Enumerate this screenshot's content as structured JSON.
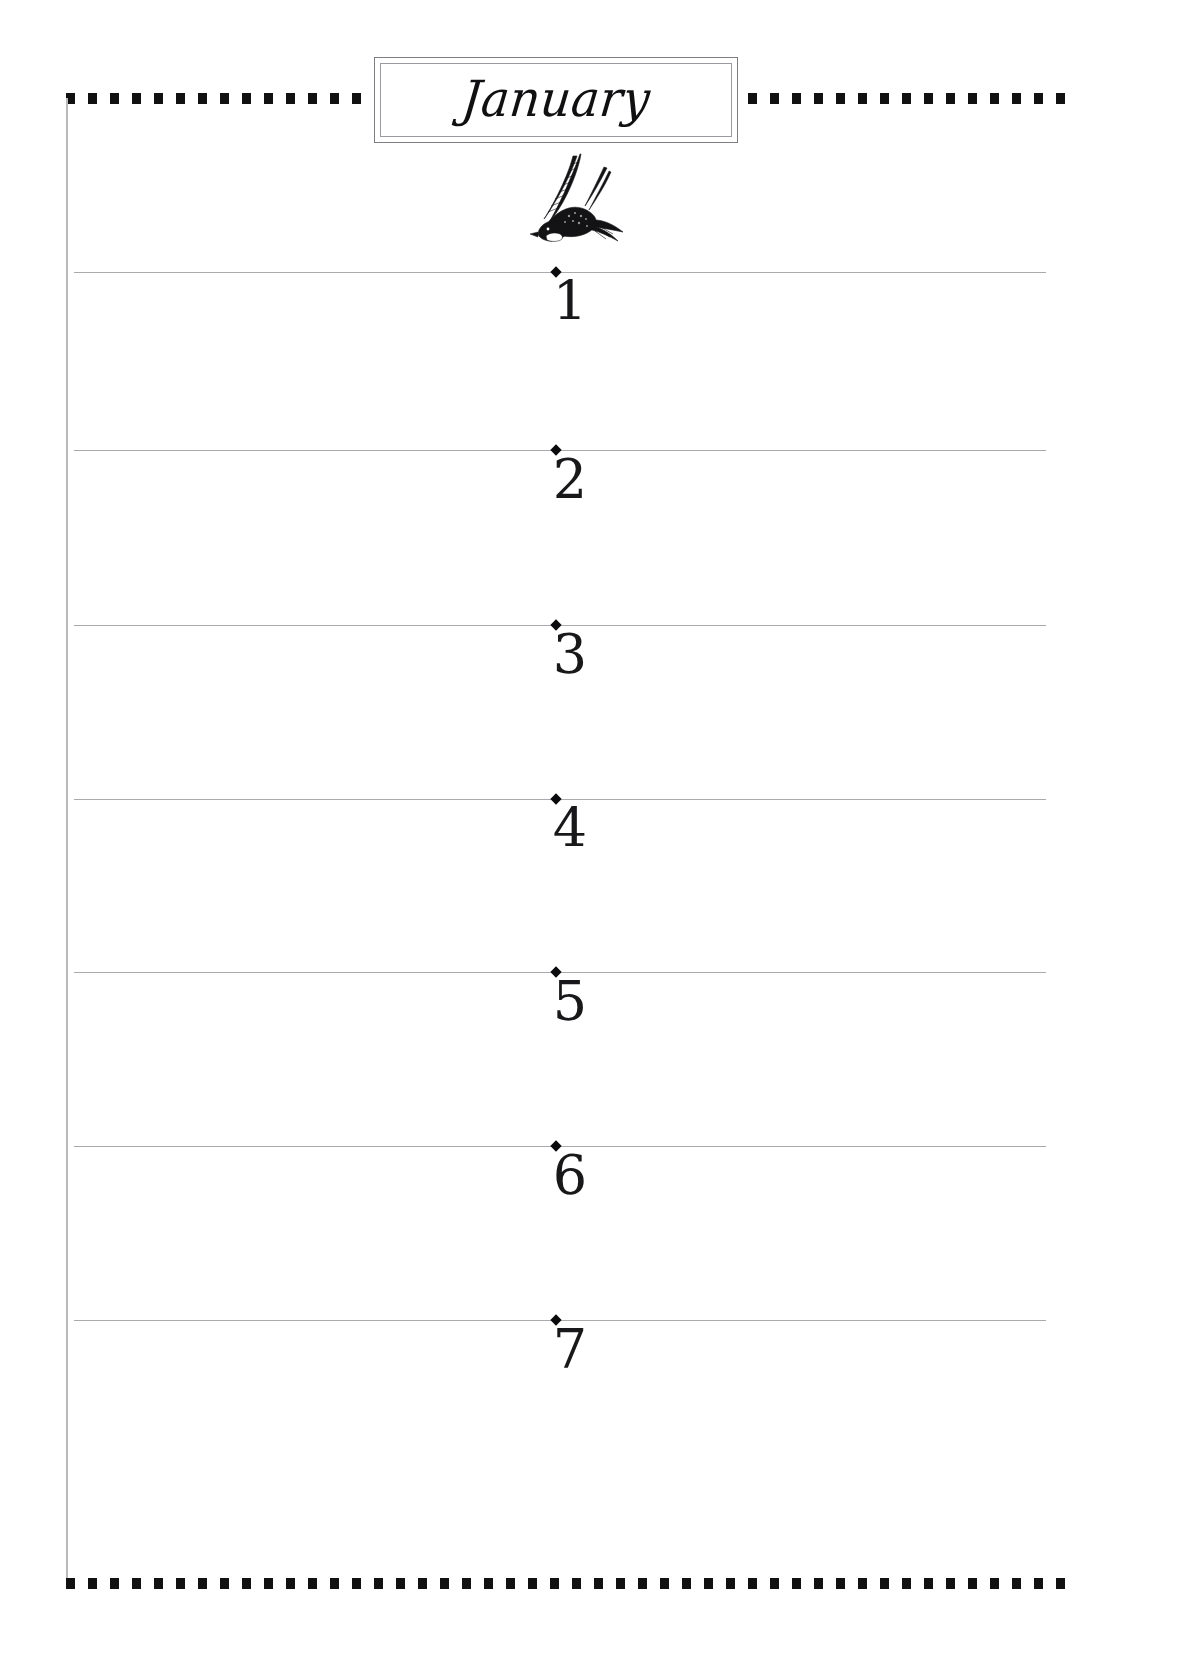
{
  "page": {
    "title": "January",
    "illustration": "swallow-bird-engraving",
    "background_color": "#ffffff",
    "ink_color": "#18181b",
    "rule_color": "#a9a9ae",
    "border_color": "#111111"
  },
  "frame": {
    "top_border_style": "square-dotted",
    "bottom_border_style": "square-dotted",
    "left_border_style": "solid-thin-rule",
    "right_border_style": "none"
  },
  "days": [
    {
      "number": "1",
      "top": 272
    },
    {
      "number": "2",
      "top": 450
    },
    {
      "number": "3",
      "top": 625
    },
    {
      "number": "4",
      "top": 799
    },
    {
      "number": "5",
      "top": 972
    },
    {
      "number": "6",
      "top": 1146
    },
    {
      "number": "7",
      "top": 1320
    }
  ]
}
